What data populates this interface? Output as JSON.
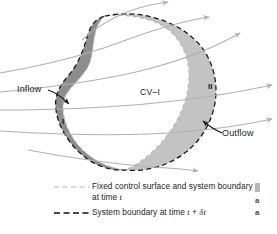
{
  "figure": {
    "title_hidden": "Control volume and system boundary at successive times",
    "region_labels": {
      "control_volume": "CV–I",
      "region_one": "I",
      "region_two": "II"
    },
    "annotations": {
      "inflow": "Inflow",
      "outflow": "Outflow"
    },
    "legend": [
      {
        "key": "light-gray-dashed-line",
        "line_color": "#b3b3b3",
        "text_before_italic": "Fixed control surface and system boundary at time ",
        "italic": "t",
        "text_after_italic": ""
      },
      {
        "key": "black-dashed-line",
        "line_color": "#111111",
        "text_before_italic": "System boundary at time ",
        "italic": "t",
        "mid": " + ",
        "italic2": "δt",
        "text_after_italic": ""
      }
    ],
    "caption_fragment": {
      "line1": "a",
      "line2": "a"
    },
    "colors": {
      "region_one_fill": "#8e8e8e",
      "region_two_fill": "#c4c4c4",
      "streamline": "#b0b0b0",
      "system_boundary": "#141414",
      "control_surface": "#b8b8b8",
      "background": "#ffffff",
      "text": "#1d1d1d"
    },
    "streamline_count": 6
  }
}
